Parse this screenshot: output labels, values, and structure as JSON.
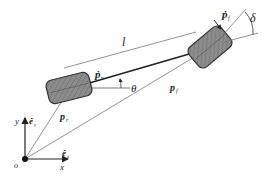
{
  "diagram": {
    "type": "bicycle-vehicle-kinematic-model",
    "colors": {
      "background": "#ffffff",
      "line": "#333333",
      "thin_line": "#777777",
      "wheel_fill": "#8c8c8c",
      "wheel_stroke": "#333333"
    },
    "labels": {
      "wheelbase": "l",
      "heading_angle": "θ",
      "steering_angle": "δ",
      "rear_velocity": "ṗ",
      "rear_velocity_sub": "r",
      "front_velocity": "ṗ",
      "front_velocity_sub": "f",
      "rear_position": "p",
      "rear_position_sub": "r",
      "front_position": "p",
      "front_position_sub": "f",
      "origin": "o",
      "x_axis": "x",
      "y_axis": "y",
      "x_unit": "ê",
      "x_unit_sub": "x",
      "y_unit": "ê",
      "y_unit_sub": "y"
    },
    "nodes": [
      {
        "id": "origin",
        "label": "o"
      },
      {
        "id": "rear-wheel",
        "label": "rear wheel"
      },
      {
        "id": "front-wheel",
        "label": "front wheel"
      }
    ],
    "edges": [
      {
        "from": "origin",
        "to": "rear-wheel",
        "label": "p_r"
      },
      {
        "from": "origin",
        "to": "front-wheel",
        "label": "p_f"
      },
      {
        "from": "rear-wheel",
        "to": "front-wheel",
        "label": "l"
      }
    ]
  }
}
